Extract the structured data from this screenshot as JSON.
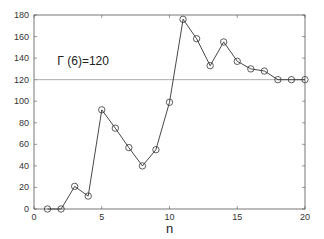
{
  "chart_data": {
    "type": "line",
    "title": "",
    "xlabel": "n",
    "ylabel": "",
    "xlim": [
      0,
      20
    ],
    "ylim": [
      0,
      180
    ],
    "xticks": [
      0,
      5,
      10,
      15,
      20
    ],
    "yticks": [
      0,
      20,
      40,
      60,
      80,
      100,
      120,
      140,
      160,
      180
    ],
    "grid": false,
    "legend": null,
    "series": [
      {
        "name": "values",
        "marker": "circle",
        "x": [
          1,
          2,
          3,
          4,
          5,
          6,
          7,
          8,
          9,
          10,
          11,
          12,
          13,
          14,
          15,
          16,
          17,
          18,
          19,
          20
        ],
        "y": [
          0,
          0,
          21,
          12,
          92,
          75,
          57,
          40,
          55,
          99,
          176,
          158,
          133,
          155,
          137,
          130,
          128,
          120,
          120,
          120
        ]
      }
    ],
    "reference_line": {
      "y": 120
    },
    "annotation": {
      "text": "Γ (6)=120",
      "x": 1.5,
      "y": 137
    },
    "colors": {
      "line": "#333333",
      "reference": "#999999",
      "axis": "#555555"
    }
  }
}
